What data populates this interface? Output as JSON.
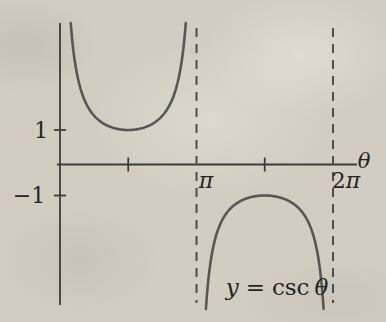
{
  "figure": {
    "background_color": "#d2cdc0",
    "axis_color": "#3c3c3c",
    "curve_color": "#575757",
    "dash_color": "#4e4e4e",
    "text_color": "#242424"
  },
  "labels": {
    "y_pos_one": "1",
    "y_neg_one": "−1",
    "x_pi": "π",
    "x_two_pi_digit": "2",
    "x_two_pi_symbol": "π",
    "x_axis_variable": "θ"
  },
  "equation": {
    "lhs": "y",
    "rel": "=",
    "func": "csc",
    "arg": "θ"
  },
  "chart_data": {
    "type": "line",
    "title": "",
    "xlabel": "θ",
    "ylabel": "",
    "x_range": [
      0,
      6.9
    ],
    "y_range": [
      -4.8,
      4.2
    ],
    "grid": false,
    "legend": false,
    "x_ticks": [
      {
        "theta": 1.5708,
        "label": ""
      },
      {
        "theta": 3.1416,
        "label": "π"
      },
      {
        "theta": 4.7124,
        "label": ""
      },
      {
        "theta": 6.2832,
        "label": "2π"
      }
    ],
    "y_ticks": [
      {
        "value": 1,
        "label": "1"
      },
      {
        "value": -1,
        "label": "−1"
      }
    ],
    "asymptotes_theta": [
      3.1416,
      6.2832
    ],
    "series": [
      {
        "name": "y = csc θ",
        "function": "csc",
        "branches": [
          {
            "theta_start": 0.2465,
            "theta_end": 2.8951
          },
          {
            "theta_start": 3.358,
            "theta_end": 6.0668
          }
        ],
        "sample_points": [
          {
            "theta": 0.5236,
            "y": 2.0
          },
          {
            "theta": 0.7854,
            "y": 1.4142
          },
          {
            "theta": 1.5708,
            "y": 1.0
          },
          {
            "theta": 2.3562,
            "y": 1.4142
          },
          {
            "theta": 2.618,
            "y": 2.0
          },
          {
            "theta": 3.6652,
            "y": -2.0
          },
          {
            "theta": 3.927,
            "y": -1.4142
          },
          {
            "theta": 4.7124,
            "y": -1.0
          },
          {
            "theta": 5.4978,
            "y": -1.4142
          },
          {
            "theta": 5.7596,
            "y": -2.0
          }
        ]
      }
    ]
  }
}
